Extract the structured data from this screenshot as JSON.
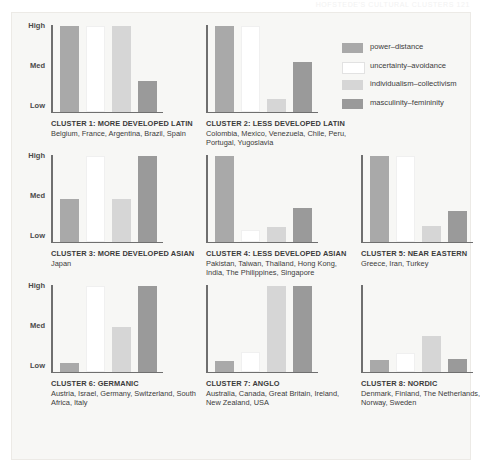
{
  "faint_header": "HOFSTEDE'S CULTURAL CLUSTERS  121",
  "legend": {
    "items": [
      {
        "label": "power–distance",
        "color": "#a9a9a9"
      },
      {
        "label": "uncertainty–avoidance",
        "color": "#ffffff"
      },
      {
        "label": "individualism–collectivism",
        "color": "#d6d6d6"
      },
      {
        "label": "masculinity–femininity",
        "color": "#9a9a9a"
      }
    ]
  },
  "axis": {
    "ticks": [
      "High",
      "Med",
      "Low"
    ]
  },
  "chart_data": {
    "type": "bar",
    "title": "",
    "xlabel": "",
    "ylabel": "",
    "ylim": [
      0,
      100
    ],
    "ytick_labels": [
      "Low",
      "Med",
      "High"
    ],
    "ytick_values": [
      0,
      50,
      100
    ],
    "grid": false,
    "legend_position": "right",
    "categories": [
      "power–distance",
      "uncertainty–avoidance",
      "individualism–collectivism",
      "masculinity–femininity"
    ],
    "series": [
      {
        "name": "CLUSTER 1: MORE DEVELOPED LATIN",
        "countries": "Belgium, France, Argentina, Brazil, Spain",
        "values": [
          100,
          100,
          100,
          35
        ]
      },
      {
        "name": "CLUSTER 2: LESS DEVELOPED LATIN",
        "countries": "Colombia, Mexico, Venezuela, Chile, Peru, Portugal, Yugoslavia",
        "values": [
          100,
          100,
          14,
          58
        ]
      },
      {
        "name": "CLUSTER 3: MORE DEVELOPED ASIAN",
        "countries": "Japan",
        "values": [
          50,
          100,
          49,
          100
        ]
      },
      {
        "name": "CLUSTER 4: LESS DEVELOPED ASIAN",
        "countries": "Pakistan, Taiwan, Thailand, Hong Kong, India, The Philippines, Singapore",
        "values": [
          100,
          13,
          17,
          39
        ]
      },
      {
        "name": "CLUSTER 5: NEAR EASTERN",
        "countries": "Greece, Iran, Turkey",
        "values": [
          100,
          100,
          18,
          36
        ]
      },
      {
        "name": "CLUSTER 6: GERMANIC",
        "countries": "Austria, Israel, Germany, Switzerland, South Africa, Italy",
        "values": [
          10,
          100,
          52,
          100
        ]
      },
      {
        "name": "CLUSTER 7: ANGLO",
        "countries": "Australia, Canada, Great Britain, Ireland, New Zealand, USA",
        "values": [
          12,
          23,
          100,
          100
        ]
      },
      {
        "name": "CLUSTER 8: NORDIC",
        "countries": "Denmark, Finland, The Netherlands, Norway, Sweden",
        "values": [
          13,
          21,
          41,
          15
        ]
      }
    ]
  }
}
